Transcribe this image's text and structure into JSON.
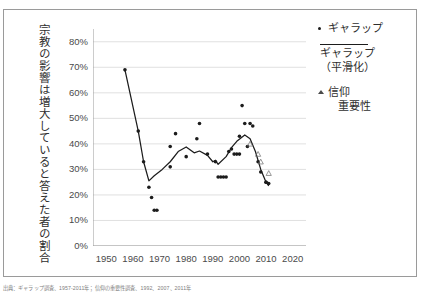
{
  "figure": {
    "vertical_axis_title": "宗教の影響は増大していると答えた者の割合",
    "caption": "出典：ギャラップ調査、1957-2011年；信仰の重要性調査、1992、2007、2011年"
  },
  "legend": {
    "items": [
      {
        "label": "ギャラップ",
        "marker": "dot-marker"
      },
      {
        "label": "ギャラップ",
        "label2": "（平滑化）",
        "marker": "line-marker"
      },
      {
        "label": "信仰",
        "label2": "重要性",
        "marker": "triangle-marker"
      }
    ]
  },
  "chart_data": {
    "type": "scatter",
    "title": "",
    "xlabel": "",
    "ylabel": "宗教の影響は増大していると答えた者の割合",
    "xlim": [
      1945,
      2025
    ],
    "ylim": [
      0,
      85
    ],
    "xticks": [
      1950,
      1960,
      1970,
      1980,
      1990,
      2000,
      2010,
      2020
    ],
    "xtick_labels": [
      "1950",
      "1960",
      "1970",
      "1980",
      "1990",
      "2000",
      "2010",
      "2020"
    ],
    "yticks": [
      0,
      10,
      20,
      30,
      40,
      50,
      60,
      70,
      80
    ],
    "ytick_labels": [
      "0%",
      "10%",
      "20%",
      "30%",
      "40%",
      "50%",
      "60%",
      "70%",
      "80%"
    ],
    "grid": "horizontal",
    "legend_position": "right",
    "series": [
      {
        "name": "ギャラップ",
        "type": "scatter",
        "marker": "dot",
        "color": "#1c1c1c",
        "points": [
          [
            1957,
            69.0
          ],
          [
            1962,
            45.0
          ],
          [
            1964,
            33.0
          ],
          [
            1966,
            23.0
          ],
          [
            1967,
            19.0
          ],
          [
            1968,
            14.0
          ],
          [
            1969,
            14.0
          ],
          [
            1974,
            31.0
          ],
          [
            1974,
            39.0
          ],
          [
            1976,
            44.0
          ],
          [
            1980,
            35.0
          ],
          [
            1984,
            42.0
          ],
          [
            1985,
            48.0
          ],
          [
            1988,
            36.0
          ],
          [
            1991,
            33.0
          ],
          [
            1992,
            27.0
          ],
          [
            1993,
            27.0
          ],
          [
            1994,
            27.0
          ],
          [
            1995,
            27.0
          ],
          [
            1996,
            37.0
          ],
          [
            1997,
            38.0
          ],
          [
            1998,
            36.0
          ],
          [
            1999,
            36.0
          ],
          [
            2000,
            36.0
          ],
          [
            2000,
            43.0
          ],
          [
            2001,
            55.0
          ],
          [
            2002,
            48.0
          ],
          [
            2003,
            39.0
          ],
          [
            2004,
            48.0
          ],
          [
            2005,
            47.0
          ],
          [
            2007,
            33.0
          ],
          [
            2008,
            29.0
          ],
          [
            2010,
            25.0
          ],
          [
            2010,
            25.0
          ],
          [
            2011,
            24.5
          ]
        ]
      },
      {
        "name": "ギャラップ（平滑化）",
        "type": "line",
        "color": "#1c1c1c",
        "points": [
          [
            1957,
            69.0
          ],
          [
            1962,
            45.0
          ],
          [
            1964,
            33.0
          ],
          [
            1966,
            25.5
          ],
          [
            1968,
            27.5
          ],
          [
            1971,
            30.0
          ],
          [
            1974,
            33.0
          ],
          [
            1977,
            37.0
          ],
          [
            1980,
            38.8
          ],
          [
            1983,
            36.5
          ],
          [
            1985,
            37.2
          ],
          [
            1988,
            35.5
          ],
          [
            1990,
            33.0
          ],
          [
            1991,
            33.6
          ],
          [
            1992,
            32.0
          ],
          [
            1995,
            35.0
          ],
          [
            1997,
            38.5
          ],
          [
            1999,
            41.0
          ],
          [
            2002,
            43.5
          ],
          [
            2004,
            42.0
          ],
          [
            2006,
            37.0
          ],
          [
            2008,
            30.0
          ],
          [
            2010,
            25.0
          ],
          [
            2011,
            23.5
          ]
        ]
      },
      {
        "name": "信仰重要性",
        "type": "scatter",
        "marker": "triangle-open",
        "color": "#6b6b6b",
        "points": [
          [
            2004,
            40.0
          ],
          [
            2007,
            36.0
          ],
          [
            2008,
            33.0
          ],
          [
            2011,
            28.5
          ]
        ]
      }
    ]
  }
}
